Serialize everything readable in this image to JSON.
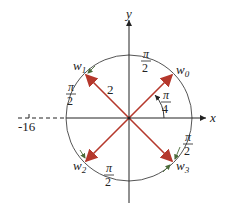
{
  "axes": {
    "x_label": "x",
    "y_label": "y",
    "neg_real_tick_label": "-16"
  },
  "circle": {
    "radius_label": "2",
    "center": [
      129,
      118
    ],
    "radius_px": 63
  },
  "roots": [
    {
      "name": "w",
      "sub": "0",
      "angle_deg": 45
    },
    {
      "name": "w",
      "sub": "1",
      "angle_deg": 135
    },
    {
      "name": "w",
      "sub": "2",
      "angle_deg": 225
    },
    {
      "name": "w",
      "sub": "3",
      "angle_deg": 315
    }
  ],
  "angle_labels": {
    "first_angle": {
      "num": "π",
      "den": "4"
    },
    "arc_top": {
      "num": "π",
      "den": "2"
    },
    "arc_left": {
      "num": "π",
      "den": "2"
    },
    "arc_bottom": {
      "num": "π",
      "den": "2"
    },
    "arc_right": {
      "num": "π",
      "den": "2"
    }
  },
  "colors": {
    "vector": "#b5382c",
    "axis": "#222222",
    "circle": "#555555",
    "arc_arrow": "#4a6b3a"
  }
}
